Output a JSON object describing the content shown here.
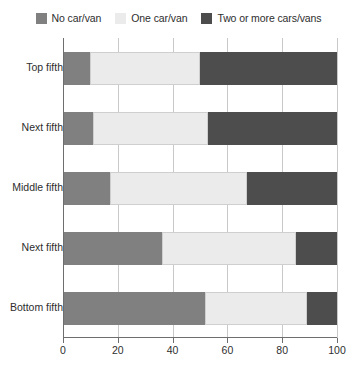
{
  "chart_data": {
    "type": "bar",
    "orientation": "horizontal",
    "stacked": true,
    "title": "",
    "subtitle": "",
    "xlabel": "",
    "ylabel": "",
    "xlim": [
      0,
      100
    ],
    "xticks": [
      0,
      20,
      40,
      60,
      80,
      100
    ],
    "xtick_labels": [
      "0",
      "20",
      "40",
      "60",
      "80",
      "100"
    ],
    "grid": true,
    "grid_axis": "x",
    "legend_position": "top-center",
    "categories": [
      "Top fifth",
      "Next fifth",
      "Middle fifth",
      "Next fifth",
      "Bottom fifth"
    ],
    "series": [
      {
        "name": "No car/van",
        "color": "#808080",
        "values": [
          10,
          11,
          17,
          36,
          52
        ]
      },
      {
        "name": "One car/van",
        "color": "#ebebeb",
        "values": [
          40,
          42,
          50,
          49,
          37
        ]
      },
      {
        "name": "Two or more cars/vans",
        "color": "#4d4d4d",
        "values": [
          50,
          47,
          33,
          15,
          11
        ]
      }
    ]
  },
  "legend": {
    "items": [
      {
        "label": "No car/van",
        "swatch": "legend-swatch-no-car",
        "color": "#808080"
      },
      {
        "label": "One car/van",
        "swatch": "legend-swatch-one-car",
        "color": "#ebebeb"
      },
      {
        "label": "Two or more cars/vans",
        "swatch": "legend-swatch-two-plus-cars",
        "color": "#4d4d4d"
      }
    ]
  },
  "axis": {
    "x_labels": [
      "0",
      "20",
      "40",
      "60",
      "80",
      "100"
    ]
  },
  "categories": {
    "labels": [
      "Top fifth",
      "Next fifth",
      "Middle fifth",
      "Next fifth",
      "Bottom fifth"
    ]
  }
}
